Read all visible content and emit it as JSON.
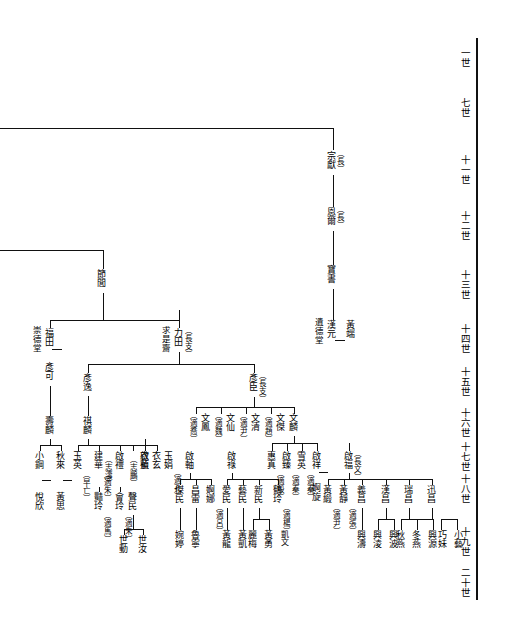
{
  "meta": {
    "ink": "#111111",
    "paper": "#ffffff"
  },
  "generation_axis": {
    "name": "generation-scale",
    "labels": [
      {
        "text": "一世",
        "y": 55
      },
      {
        "text": "七世",
        "y": 105
      },
      {
        "text": "十一世",
        "y": 168
      },
      {
        "text": "十二世",
        "y": 224
      },
      {
        "text": "十三世",
        "y": 283
      },
      {
        "text": "十四世",
        "y": 337
      },
      {
        "text": "十五世",
        "y": 380
      },
      {
        "text": "十六世",
        "y": 421
      },
      {
        "text": "十七世",
        "y": 455
      },
      {
        "text": "十八世",
        "y": 487
      },
      {
        "text": "十九世",
        "y": 540
      },
      {
        "text": "二十世",
        "y": 581
      }
    ]
  },
  "people": {
    "zongxian": {
      "name": "宗獻",
      "tag": "（長）"
    },
    "ener": {
      "name": "恩爾",
      "tag": "（長）"
    },
    "baoshu": {
      "name": "寶書",
      "tag": ""
    },
    "hanyuan": {
      "name": "漢元",
      "tag": "",
      "hall": "遺德堂",
      "spouse": "黃端"
    },
    "jielv": {
      "name": "節閭",
      "tag": ""
    },
    "futian": {
      "name": "福田",
      "tag": "",
      "hall": "崇德堂",
      "spouse": "彥可"
    },
    "litian": {
      "name": "力田",
      "tag": "（長支）",
      "hall": "求是齋"
    },
    "yanke": {
      "name": "彥可",
      "tag": ""
    },
    "yanyi": {
      "name": "彥逸",
      "tag": ""
    },
    "yanchen": {
      "name": "彥臣",
      "tag": "（長支）"
    },
    "shoulin": {
      "name": "壽麟",
      "tag": ""
    },
    "qilin": {
      "name": "祺麟",
      "tag": ""
    },
    "wenfeng": {
      "name": "文鳳",
      "tag": "（適喬）"
    },
    "wenxian": {
      "name": "文仙",
      "tag": "（適魏）"
    },
    "wenqing": {
      "name": "文清",
      "tag": "（適尹）"
    },
    "wenjie": {
      "name": "文傑",
      "tag": "（適趙）"
    },
    "wenlin": {
      "name": "文麟",
      "tag": ""
    },
    "xiaogang": {
      "name": "小鋼",
      "tag": ""
    },
    "qiulai": {
      "name": "秋來",
      "tag": "",
      "spouse": "黃思"
    },
    "yuexin": {
      "name": "悅欣",
      "tag": ""
    },
    "yuying": {
      "name": "玉英",
      "tag": "（早亡）"
    },
    "jianhua": {
      "name": "建華",
      "tag": "（適朱）"
    },
    "yanling": {
      "name": "豔玲",
      "tag": "（適馬）"
    },
    "qili": {
      "name": "啟禮",
      "tag": "（志濤）"
    },
    "huiling": {
      "name": "會玲",
      "tag": "（適朱）"
    },
    "qizhen": {
      "name": "啟禎",
      "tag": "（志鵬）"
    },
    "shengmin": {
      "name": "聲民",
      "tag": ""
    },
    "yilan": {
      "name": "衣藍",
      "tag": ""
    },
    "yixuan": {
      "name": "衣玄",
      "tag": ""
    },
    "shidong": {
      "name": "世動",
      "tag": ""
    },
    "shiru": {
      "name": "世汝",
      "tag": ""
    },
    "yujuan": {
      "name": "玉娟",
      "tag": "（適孔）"
    },
    "qizhou": {
      "name": "啟軸",
      "tag": ""
    },
    "jiemin": {
      "name": "傑民",
      "tag": ""
    },
    "changlei": {
      "name": "昌雷",
      "tag": ""
    },
    "enuo": {
      "name": "婀娜",
      "tag": "（適呂）"
    },
    "wanting": {
      "name": "婉婷",
      "tag": ""
    },
    "luning": {
      "name": "魯寧",
      "tag": ""
    },
    "qilu": {
      "name": "啟祿",
      "tag": ""
    },
    "aimin": {
      "name": "愛民",
      "tag": ""
    },
    "yimin": {
      "name": "藝民",
      "tag": ""
    },
    "xinmin": {
      "name": "新民",
      "tag": ""
    },
    "heling": {
      "name": "鶴玲",
      "tag": "（適楊）"
    },
    "huanglong": {
      "name": "黃龍",
      "tag": ""
    },
    "huangkai": {
      "name": "黃凱",
      "tag": ""
    },
    "limei": {
      "name": "麗梅",
      "tag": ""
    },
    "huangyong": {
      "name": "黃勇",
      "tag": ""
    },
    "kaiwen": {
      "name": "凱文",
      "tag": ""
    },
    "huizhen": {
      "name": "惠真",
      "tag": "（適殷）"
    },
    "qizhen2": {
      "name": "啟臻",
      "tag": "（適秦）"
    },
    "xueying": {
      "name": "雪英",
      "tag": "（適秦）"
    },
    "qixiang": {
      "name": "啟祥",
      "tag": "",
      "spouse": "婀旋"
    },
    "exuan": {
      "name": "婀旋",
      "tag": ""
    },
    "qifu": {
      "name": "啟福",
      "tag": "（長文）"
    },
    "huangduan": {
      "name": "黃緞",
      "tag": "（適尹）"
    },
    "huangjing": {
      "name": "黃靜",
      "tag": "（適張）"
    },
    "yichang": {
      "name": "義昌",
      "tag": ""
    },
    "hanchang": {
      "name": "漢昌",
      "tag": ""
    },
    "ruichang": {
      "name": "瑞昌",
      "tag": ""
    },
    "xunchang": {
      "name": "迅昌",
      "tag": ""
    },
    "xingtao": {
      "name": "興濤",
      "tag": ""
    },
    "xingling": {
      "name": "興淩",
      "tag": ""
    },
    "xingbo": {
      "name": "興波",
      "tag": ""
    },
    "qiuyan": {
      "name": "秋燕",
      "tag": ""
    },
    "dongyan": {
      "name": "冬燕",
      "tag": ""
    },
    "xingyuan": {
      "name": "興源",
      "tag": ""
    },
    "qiaomei": {
      "name": "巧妹",
      "tag": ""
    },
    "xiaoyi": {
      "name": "小藝",
      "tag": ""
    }
  },
  "notes": {
    "hall_left_of_futian": "崇德堂",
    "hall_left_of_litian": "求是齋",
    "hall_left_of_hanyuan": "遺德堂"
  }
}
